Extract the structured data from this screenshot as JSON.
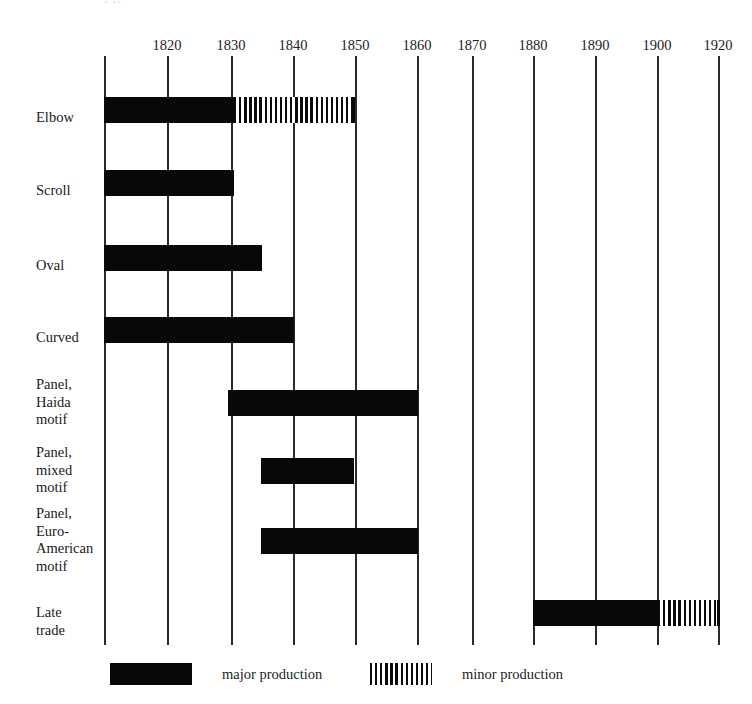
{
  "caption_fragment": {
    "text": "·                                 ··"
  },
  "chart_data": {
    "type": "bar",
    "orientation": "horizontal-timeline",
    "title": "",
    "subtitle": "",
    "xlabel": "",
    "ylabel": "",
    "grid": true,
    "legend_position": "bottom",
    "xlim": [
      1810,
      1920
    ],
    "axis_ticks": [
      {
        "label": "1820",
        "value": 1820,
        "x": 167
      },
      {
        "label": "1830",
        "value": 1830,
        "x": 231
      },
      {
        "label": "1840",
        "value": 1840,
        "x": 293
      },
      {
        "label": "1850",
        "value": 1850,
        "x": 355
      },
      {
        "label": "1860",
        "value": 1860,
        "x": 417
      },
      {
        "label": "1870",
        "value": 1870,
        "x": 472
      },
      {
        "label": "1880",
        "value": 1880,
        "x": 533
      },
      {
        "label": "1890",
        "value": 1890,
        "x": 595
      },
      {
        "label": "1900",
        "value": 1900,
        "x": 657
      },
      {
        "label": "1920",
        "value": 1920,
        "x": 718
      }
    ],
    "gridline_x": [
      104,
      167,
      231,
      293,
      355,
      417,
      472,
      533,
      595,
      657,
      718
    ],
    "categories": [
      "Elbow",
      "Scroll",
      "Oval",
      "Curved",
      "Panel, Haida motif",
      "Panel, mixed motif",
      "Panel, Euro-American motif",
      "Late trade"
    ],
    "series": [
      {
        "name": "major production",
        "key": "major",
        "color": "#080808",
        "pattern": "solid"
      },
      {
        "name": "minor production",
        "key": "minor",
        "color": "#0a0a0a",
        "pattern": "vertical-hatch"
      }
    ],
    "rows": [
      {
        "category": "Elbow",
        "label_lines": [
          "Elbow"
        ],
        "y": 97,
        "height": 26,
        "label_top": 109,
        "bars": [
          {
            "type": "major",
            "start": 1810,
            "end": 1830,
            "x": 104,
            "width": 130
          },
          {
            "type": "minor",
            "start": 1830,
            "end": 1850,
            "x": 234,
            "width": 121
          }
        ]
      },
      {
        "category": "Scroll",
        "label_lines": [
          "Scroll"
        ],
        "y": 170,
        "height": 26,
        "label_top": 182,
        "bars": [
          {
            "type": "major",
            "start": 1810,
            "end": 1830,
            "x": 104,
            "width": 130
          }
        ]
      },
      {
        "category": "Oval",
        "label_lines": [
          "Oval"
        ],
        "y": 245,
        "height": 26,
        "label_top": 257,
        "bars": [
          {
            "type": "major",
            "start": 1810,
            "end": 1835,
            "x": 104,
            "width": 158
          }
        ]
      },
      {
        "category": "Curved",
        "label_lines": [
          "Curved"
        ],
        "y": 317,
        "height": 26,
        "label_top": 329,
        "bars": [
          {
            "type": "major",
            "start": 1810,
            "end": 1840,
            "x": 104,
            "width": 190
          }
        ]
      },
      {
        "category": "Panel, Haida motif",
        "label_lines": [
          "Panel,",
          "Haida",
          "motif"
        ],
        "y": 390,
        "height": 26,
        "label_top": 376,
        "bars": [
          {
            "type": "major",
            "start": 1830,
            "end": 1860,
            "x": 228,
            "width": 190
          }
        ]
      },
      {
        "category": "Panel, mixed motif",
        "label_lines": [
          "Panel,",
          "mixed",
          "motif"
        ],
        "y": 458,
        "height": 26,
        "label_top": 444,
        "bars": [
          {
            "type": "major",
            "start": 1835,
            "end": 1850,
            "x": 261,
            "width": 93
          }
        ]
      },
      {
        "category": "Panel, Euro-American motif",
        "label_lines": [
          "Panel,",
          "Euro-",
          "American",
          "motif"
        ],
        "y": 528,
        "height": 26,
        "label_top": 505,
        "bars": [
          {
            "type": "major",
            "start": 1835,
            "end": 1860,
            "x": 261,
            "width": 157
          }
        ]
      },
      {
        "category": "Late trade",
        "label_lines": [
          "Late",
          "trade"
        ],
        "y": 600,
        "height": 26,
        "label_top": 604,
        "bars": [
          {
            "type": "major",
            "start": 1880,
            "end": 1900,
            "x": 533,
            "width": 125
          },
          {
            "type": "minor",
            "start": 1900,
            "end": 1920,
            "x": 658,
            "width": 62
          }
        ]
      }
    ]
  },
  "legend": {
    "items": [
      {
        "label": "major production",
        "type": "major",
        "swatch_x": 110,
        "swatch_width": 82,
        "text_x": 222
      },
      {
        "label": "minor production",
        "type": "minor",
        "swatch_x": 370,
        "swatch_width": 62,
        "text_x": 462
      }
    ],
    "y": 663
  }
}
